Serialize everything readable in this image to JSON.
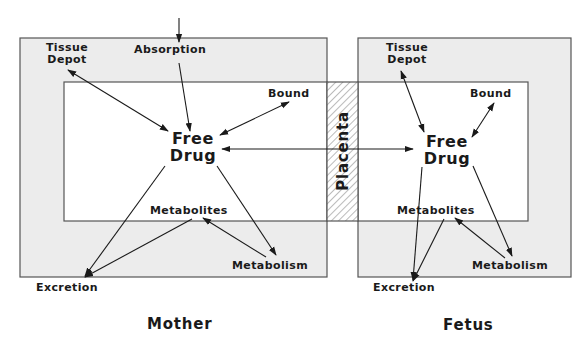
{
  "colors": {
    "compartment_fill": "#ececec",
    "inner_fill": "#ffffff",
    "stroke": "#555555",
    "arrow": "#1a1a1a",
    "hatch": "#777777"
  },
  "mother": {
    "title": "Mother",
    "input_label": "Absorption",
    "tissue_depot": [
      "Tissue",
      "Depot"
    ],
    "bound": "Bound",
    "free_drug": [
      "Free",
      "Drug"
    ],
    "metabolites": "Metabolites",
    "metabolism": "Metabolism",
    "excretion": "Excretion"
  },
  "fetus": {
    "title": "Fetus",
    "tissue_depot": [
      "Tissue",
      "Depot"
    ],
    "bound": "Bound",
    "free_drug": [
      "Free",
      "Drug"
    ],
    "metabolites": "Metabolites",
    "metabolism": "Metabolism",
    "excretion": "Excretion"
  },
  "barrier": {
    "label": "Placenta"
  }
}
